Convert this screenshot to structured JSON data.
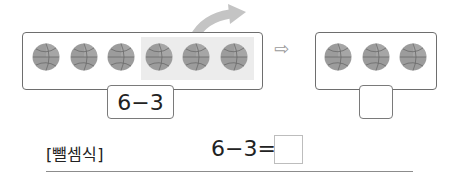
{
  "problem": {
    "left_group": {
      "ball_count": 6,
      "highlighted_count": 3,
      "icon": "basketball-icon"
    },
    "left_expression": "6−3",
    "transform_arrow": "⇨",
    "right_group": {
      "ball_count": 3,
      "icon": "basketball-icon"
    },
    "right_answer": ""
  },
  "equation": {
    "label": "[뺄셈식]",
    "expression": "6−3=",
    "answer": ""
  },
  "colors": {
    "frame": "#6e6e6e",
    "highlight": "#ececec",
    "ball": "#9a9a9a",
    "arrow": "#bdbdbd"
  }
}
